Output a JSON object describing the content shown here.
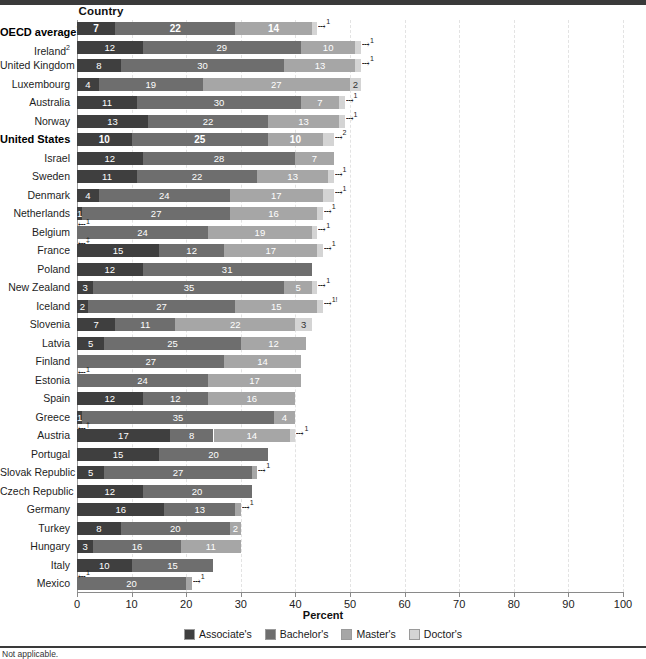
{
  "header": {
    "country_column": "Country"
  },
  "axis": {
    "title": "Percent",
    "ticks": [
      0,
      10,
      20,
      30,
      40,
      50,
      60,
      70,
      80,
      90,
      100
    ],
    "min": 0,
    "max": 100
  },
  "legend": {
    "items": [
      {
        "label": "Associate's",
        "color": "#3f3f3f"
      },
      {
        "label": "Bachelor's",
        "color": "#6e6e6e"
      },
      {
        "label": "Master's",
        "color": "#a6a6a6"
      },
      {
        "label": "Doctor's",
        "color": "#d4d4d4"
      }
    ]
  },
  "footnote": "Not applicable.",
  "chart_data": {
    "type": "bar",
    "orientation": "horizontal",
    "stacked": true,
    "title": "",
    "xlabel": "Percent",
    "ylabel": "Country",
    "xlim": [
      0,
      100
    ],
    "grid": true,
    "legend_position": "bottom",
    "series": [
      {
        "name": "Associate's",
        "color": "#3f3f3f"
      },
      {
        "name": "Bachelor's",
        "color": "#6e6e6e"
      },
      {
        "name": "Master's",
        "color": "#a6a6a6"
      },
      {
        "name": "Doctor's",
        "color": "#d4d4d4"
      }
    ],
    "categories": [
      "OECD average",
      "Ireland",
      "United Kingdom",
      "Luxembourg",
      "Australia",
      "Norway",
      "United States",
      "Israel",
      "Sweden",
      "Denmark",
      "Netherlands",
      "Belgium",
      "France",
      "Poland",
      "New Zealand",
      "Iceland",
      "Slovenia",
      "Latvia",
      "Finland",
      "Estonia",
      "Spain",
      "Greece",
      "Austria",
      "Portugal",
      "Slovak Republic",
      "Czech Republic",
      "Germany",
      "Turkey",
      "Hungary",
      "Italy",
      "Mexico"
    ],
    "rows": [
      {
        "country": "OECD average",
        "label_sup": "1",
        "bold": true,
        "values": [
          7,
          22,
          14,
          1
        ],
        "labels": [
          "7",
          "22",
          "14",
          ""
        ],
        "end_marker": "1",
        "start_marker": ""
      },
      {
        "country": "Ireland",
        "label_sup": "2",
        "bold": false,
        "values": [
          12,
          29,
          10,
          1
        ],
        "labels": [
          "12",
          "29",
          "10",
          ""
        ],
        "end_marker": "1",
        "start_marker": ""
      },
      {
        "country": "United Kingdom",
        "label_sup": "",
        "bold": false,
        "values": [
          8,
          30,
          13,
          1
        ],
        "labels": [
          "8",
          "30",
          "13",
          ""
        ],
        "end_marker": "1",
        "start_marker": ""
      },
      {
        "country": "Luxembourg",
        "label_sup": "",
        "bold": false,
        "values": [
          4,
          19,
          27,
          2
        ],
        "labels": [
          "4",
          "19",
          "27",
          "2"
        ],
        "end_marker": "",
        "start_marker": ""
      },
      {
        "country": "Australia",
        "label_sup": "",
        "bold": false,
        "values": [
          11,
          30,
          7,
          1
        ],
        "labels": [
          "11",
          "30",
          "7",
          ""
        ],
        "end_marker": "1",
        "start_marker": ""
      },
      {
        "country": "Norway",
        "label_sup": "",
        "bold": false,
        "values": [
          13,
          22,
          13,
          1
        ],
        "labels": [
          "13",
          "22",
          "13",
          ""
        ],
        "end_marker": "1",
        "start_marker": ""
      },
      {
        "country": "United States",
        "label_sup": "",
        "bold": true,
        "values": [
          10,
          25,
          10,
          2
        ],
        "labels": [
          "10",
          "25",
          "10",
          ""
        ],
        "end_marker": "2",
        "start_marker": ""
      },
      {
        "country": "Israel",
        "label_sup": "",
        "bold": false,
        "values": [
          12,
          28,
          7,
          0
        ],
        "labels": [
          "12",
          "28",
          "7",
          ""
        ],
        "end_marker": "",
        "start_marker": ""
      },
      {
        "country": "Sweden",
        "label_sup": "",
        "bold": false,
        "values": [
          11,
          22,
          13,
          1
        ],
        "labels": [
          "11",
          "22",
          "13",
          ""
        ],
        "end_marker": "1",
        "start_marker": ""
      },
      {
        "country": "Denmark",
        "label_sup": "",
        "bold": false,
        "values": [
          4,
          24,
          17,
          2
        ],
        "labels": [
          "4",
          "24",
          "17",
          ""
        ],
        "end_marker": "1",
        "start_marker": ""
      },
      {
        "country": "Netherlands",
        "label_sup": "",
        "bold": false,
        "values": [
          1,
          27,
          16,
          1
        ],
        "labels": [
          "1",
          "27",
          "16",
          ""
        ],
        "end_marker": "1",
        "start_marker": ""
      },
      {
        "country": "Belgium",
        "label_sup": "",
        "bold": false,
        "values": [
          0,
          24,
          19,
          1
        ],
        "labels": [
          "",
          "24",
          "19",
          ""
        ],
        "end_marker": "1",
        "start_marker": "1"
      },
      {
        "country": "France",
        "label_sup": "",
        "bold": false,
        "values": [
          15,
          12,
          17,
          1
        ],
        "labels": [
          "15",
          "12",
          "17",
          ""
        ],
        "end_marker": "1",
        "start_marker": "‡"
      },
      {
        "country": "Poland",
        "label_sup": "",
        "bold": false,
        "values": [
          12,
          31,
          0,
          0
        ],
        "labels": [
          "12",
          "31",
          "",
          ""
        ],
        "end_marker": "",
        "start_marker": ""
      },
      {
        "country": "New Zealand",
        "label_sup": "",
        "bold": false,
        "values": [
          3,
          35,
          5,
          1
        ],
        "labels": [
          "3",
          "35",
          "5",
          ""
        ],
        "end_marker": "1",
        "start_marker": ""
      },
      {
        "country": "Iceland",
        "label_sup": "",
        "bold": false,
        "values": [
          2,
          27,
          15,
          1
        ],
        "labels": [
          "2",
          "27",
          "15",
          ""
        ],
        "end_marker": "1!",
        "start_marker": ""
      },
      {
        "country": "Slovenia",
        "label_sup": "",
        "bold": false,
        "values": [
          7,
          11,
          22,
          3
        ],
        "labels": [
          "7",
          "11",
          "22",
          "3"
        ],
        "end_marker": "",
        "start_marker": ""
      },
      {
        "country": "Latvia",
        "label_sup": "",
        "bold": false,
        "values": [
          5,
          25,
          12,
          0
        ],
        "labels": [
          "5",
          "25",
          "12",
          ""
        ],
        "end_marker": "",
        "start_marker": ""
      },
      {
        "country": "Finland",
        "label_sup": "",
        "bold": false,
        "values": [
          0,
          27,
          14,
          0
        ],
        "labels": [
          "",
          "27",
          "14",
          ""
        ],
        "end_marker": "",
        "start_marker": ""
      },
      {
        "country": "Estonia",
        "label_sup": "",
        "bold": false,
        "values": [
          0,
          24,
          17,
          0
        ],
        "labels": [
          "",
          "24",
          "17",
          ""
        ],
        "end_marker": "",
        "start_marker": "1"
      },
      {
        "country": "Spain",
        "label_sup": "",
        "bold": false,
        "values": [
          12,
          12,
          16,
          0
        ],
        "labels": [
          "12",
          "12",
          "16",
          ""
        ],
        "end_marker": "",
        "start_marker": ""
      },
      {
        "country": "Greece",
        "label_sup": "",
        "bold": false,
        "values": [
          1,
          35,
          4,
          0
        ],
        "labels": [
          "1",
          "35",
          "4",
          ""
        ],
        "end_marker": "",
        "start_marker": ""
      },
      {
        "country": "Austria",
        "label_sup": "",
        "bold": false,
        "values": [
          17,
          8,
          14,
          1
        ],
        "labels": [
          "17",
          "8",
          "14",
          ""
        ],
        "end_marker": "1",
        "start_marker": "†"
      },
      {
        "country": "Portugal",
        "label_sup": "",
        "bold": false,
        "values": [
          15,
          20,
          0,
          0
        ],
        "labels": [
          "15",
          "20",
          "",
          ""
        ],
        "end_marker": "",
        "start_marker": ""
      },
      {
        "country": "Slovak Republic",
        "label_sup": "",
        "bold": false,
        "values": [
          5,
          27,
          1,
          0
        ],
        "labels": [
          "5",
          "27",
          "",
          ""
        ],
        "end_marker": "1",
        "start_marker": ""
      },
      {
        "country": "Czech Republic",
        "label_sup": "",
        "bold": false,
        "values": [
          12,
          20,
          0,
          0
        ],
        "labels": [
          "12",
          "20",
          "",
          ""
        ],
        "end_marker": "",
        "start_marker": ""
      },
      {
        "country": "Germany",
        "label_sup": "",
        "bold": false,
        "values": [
          16,
          13,
          1,
          0
        ],
        "labels": [
          "16",
          "13",
          "",
          ""
        ],
        "end_marker": "1",
        "start_marker": ""
      },
      {
        "country": "Turkey",
        "label_sup": "",
        "bold": false,
        "values": [
          8,
          20,
          2,
          0
        ],
        "labels": [
          "8",
          "20",
          "2",
          ""
        ],
        "end_marker": "",
        "start_marker": ""
      },
      {
        "country": "Hungary",
        "label_sup": "",
        "bold": false,
        "values": [
          3,
          16,
          11,
          0
        ],
        "labels": [
          "3",
          "16",
          "11",
          ""
        ],
        "end_marker": "",
        "start_marker": ""
      },
      {
        "country": "Italy",
        "label_sup": "",
        "bold": false,
        "values": [
          10,
          15,
          0,
          0
        ],
        "labels": [
          "10",
          "15",
          "",
          ""
        ],
        "end_marker": "",
        "start_marker": ""
      },
      {
        "country": "Mexico",
        "label_sup": "",
        "bold": false,
        "values": [
          0,
          20,
          1,
          0
        ],
        "labels": [
          "",
          "20",
          "",
          ""
        ],
        "end_marker": "1",
        "start_marker": "1"
      }
    ]
  }
}
